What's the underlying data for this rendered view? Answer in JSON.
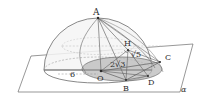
{
  "figure": {
    "background": "#ffffff",
    "stroke_color": "#5a5a5a",
    "dashed_color": "#a8a8a8",
    "disc_fill": "#b9b9b9",
    "dome_fill": "#f2f2f2",
    "plane_fill": "#ffffff"
  },
  "points": {
    "A": {
      "label": "A",
      "x": 98,
      "y": 18
    },
    "H": {
      "label": "H",
      "x": 127,
      "y": 44
    },
    "C": {
      "label": "C",
      "x": 167,
      "y": 58
    },
    "D": {
      "label": "D",
      "x": 150,
      "y": 80
    },
    "B": {
      "label": "B",
      "x": 127,
      "y": 86
    },
    "O": {
      "label": "O",
      "x": 101,
      "y": 78
    }
  },
  "measures": {
    "radius": {
      "label": "6",
      "x": 73,
      "y": 74
    },
    "segment_mid": {
      "label": "2√3",
      "x": 119,
      "y": 64
    },
    "segment_h": {
      "label": "√5",
      "x": 136,
      "y": 54
    }
  },
  "plane": {
    "label": "α",
    "x": 183,
    "y": 90
  }
}
